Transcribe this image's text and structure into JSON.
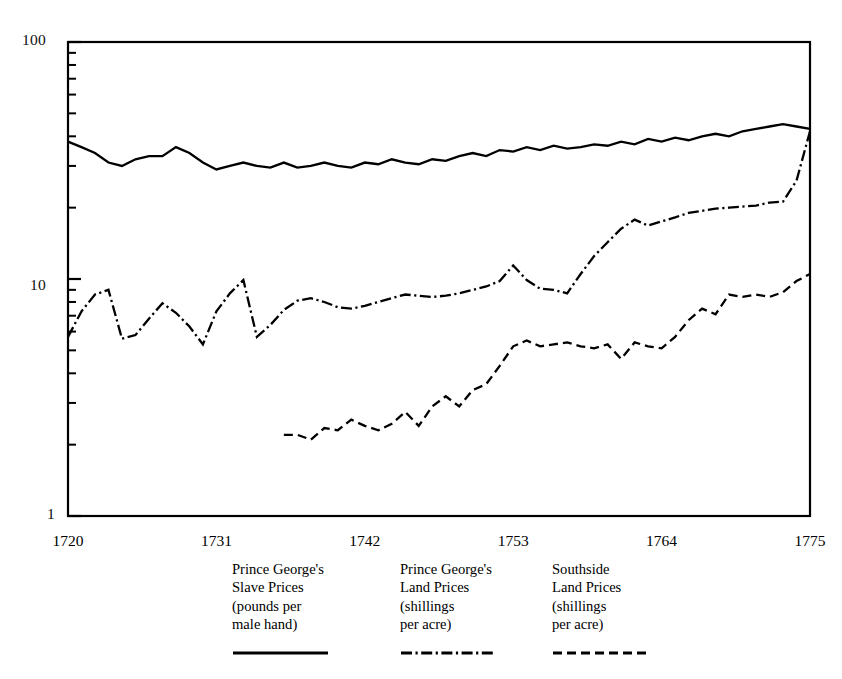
{
  "figure": {
    "background_color": "#ffffff",
    "ink_color": "#000000"
  },
  "chart_data": {
    "type": "line",
    "title": "",
    "subtitle": "",
    "xlabel": "",
    "ylabel": "",
    "y_scale": "log",
    "ylim": [
      1,
      100
    ],
    "xlim": [
      1720,
      1775
    ],
    "grid": false,
    "legend_position": "below-plot",
    "y_tick_labels": [
      "100",
      "10",
      "1"
    ],
    "y_tick_values": [
      100,
      10,
      1
    ],
    "y_minor_ticks": [
      2,
      3,
      4,
      5,
      6,
      7,
      8,
      9,
      20,
      30,
      40,
      50,
      60,
      70,
      80,
      90
    ],
    "x_tick_labels": [
      "1720",
      "1731",
      "1742",
      "1753",
      "1764",
      "1775"
    ],
    "x_tick_values": [
      1720,
      1731,
      1742,
      1753,
      1764,
      1775
    ],
    "series": [
      {
        "name": "Prince George's Slave Prices (pounds per male hand)",
        "short_name": "Prince George's Slave Prices",
        "units": "pounds per male hand",
        "style": "solid",
        "color": "#000000",
        "x": [
          1720,
          1721,
          1722,
          1723,
          1724,
          1725,
          1726,
          1727,
          1728,
          1729,
          1730,
          1731,
          1732,
          1733,
          1734,
          1735,
          1736,
          1737,
          1738,
          1739,
          1740,
          1741,
          1742,
          1743,
          1744,
          1745,
          1746,
          1747,
          1748,
          1749,
          1750,
          1751,
          1752,
          1753,
          1754,
          1755,
          1756,
          1757,
          1758,
          1759,
          1760,
          1761,
          1762,
          1763,
          1764,
          1765,
          1766,
          1767,
          1768,
          1769,
          1770,
          1771,
          1772,
          1773,
          1774,
          1775
        ],
        "values": [
          38,
          36,
          34,
          31,
          30,
          32,
          33,
          33,
          36,
          34,
          31,
          29,
          30,
          31,
          30,
          29.5,
          31,
          29.5,
          30,
          31,
          30,
          29.5,
          31,
          30.5,
          32,
          31,
          30.5,
          32,
          31.5,
          33,
          34,
          33,
          35,
          34.5,
          36,
          35,
          36.5,
          35.5,
          36,
          37,
          36.5,
          38,
          37,
          39,
          38,
          39.5,
          38.5,
          40,
          41,
          40,
          42,
          43,
          44,
          45,
          44,
          43
        ]
      },
      {
        "name": "Prince George's Land Prices (shillings per acre)",
        "short_name": "Prince George's Land Prices",
        "units": "shillings per acre",
        "style": "dash-dot",
        "color": "#000000",
        "x": [
          1720,
          1721,
          1722,
          1723,
          1724,
          1725,
          1726,
          1727,
          1728,
          1729,
          1730,
          1731,
          1732,
          1733,
          1734,
          1735,
          1736,
          1737,
          1738,
          1739,
          1740,
          1741,
          1742,
          1743,
          1744,
          1745,
          1746,
          1747,
          1748,
          1749,
          1750,
          1751,
          1752,
          1753,
          1754,
          1755,
          1756,
          1757,
          1758,
          1759,
          1760,
          1761,
          1762,
          1763,
          1764,
          1765,
          1766,
          1767,
          1768,
          1769,
          1770,
          1771,
          1772,
          1773,
          1774,
          1775
        ],
        "values": [
          5.7,
          7.3,
          8.6,
          9.0,
          5.6,
          5.8,
          6.8,
          7.9,
          7.2,
          6.3,
          5.3,
          7.3,
          8.7,
          9.9,
          5.7,
          6.4,
          7.4,
          8.1,
          8.3,
          8.0,
          7.6,
          7.5,
          7.7,
          8.0,
          8.3,
          8.6,
          8.5,
          8.4,
          8.5,
          8.7,
          9.0,
          9.3,
          9.8,
          11.4,
          9.9,
          9.1,
          9.0,
          8.7,
          10.5,
          12.5,
          14.3,
          16.3,
          17.8,
          16.8,
          17.5,
          18.2,
          19.0,
          19.4,
          19.8,
          20.0,
          20.2,
          20.4,
          21.0,
          21.2,
          26.0,
          42.0
        ]
      },
      {
        "name": "Southside Land Prices (shillings per acre)",
        "short_name": "Southside Land Prices",
        "units": "shillings per acre",
        "style": "dashed",
        "color": "#000000",
        "x": [
          1736,
          1737,
          1738,
          1739,
          1740,
          1741,
          1742,
          1743,
          1744,
          1745,
          1746,
          1747,
          1748,
          1749,
          1750,
          1751,
          1752,
          1753,
          1754,
          1755,
          1756,
          1757,
          1758,
          1759,
          1760,
          1761,
          1762,
          1763,
          1764,
          1765,
          1766,
          1767,
          1768,
          1769,
          1770,
          1771,
          1772,
          1773,
          1774,
          1775
        ],
        "values": [
          2.2,
          2.2,
          2.1,
          2.35,
          2.3,
          2.55,
          2.4,
          2.3,
          2.45,
          2.75,
          2.4,
          2.9,
          3.2,
          2.9,
          3.4,
          3.6,
          4.3,
          5.2,
          5.5,
          5.2,
          5.3,
          5.4,
          5.2,
          5.1,
          5.3,
          4.6,
          5.4,
          5.2,
          5.1,
          5.7,
          6.7,
          7.5,
          7.1,
          8.6,
          8.4,
          8.6,
          8.4,
          8.8,
          9.8,
          10.5
        ]
      }
    ]
  },
  "axes": {
    "y_labels": [
      {
        "text": "100"
      },
      {
        "text": "10"
      },
      {
        "text": "1"
      }
    ],
    "x_labels": [
      {
        "text": "1720"
      },
      {
        "text": "1731"
      },
      {
        "text": "1742"
      },
      {
        "text": "1753"
      },
      {
        "text": "1764"
      },
      {
        "text": "1775"
      }
    ]
  },
  "legend": {
    "entries": [
      {
        "lines": [
          "Prince George's",
          "Slave Prices",
          "(pounds per",
          "male hand)"
        ],
        "style": "solid"
      },
      {
        "lines": [
          "Prince George's",
          "Land Prices",
          "(shillings",
          "per acre)"
        ],
        "style": "dash-dot"
      },
      {
        "lines": [
          "Southside",
          "Land Prices",
          "(shillings",
          "per acre)"
        ],
        "style": "dashed"
      }
    ]
  }
}
